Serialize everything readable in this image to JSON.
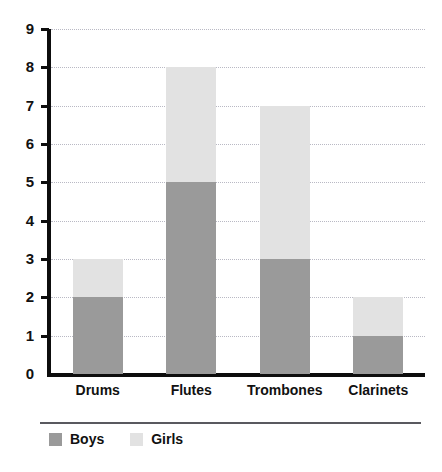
{
  "chart_data": {
    "type": "bar",
    "stacked": true,
    "title": "",
    "subtitle": "",
    "xlabel": "",
    "ylabel": "",
    "categories": [
      "Drums",
      "Flutes",
      "Trombones",
      "Clarinets"
    ],
    "series": [
      {
        "name": "Boys",
        "color": "#9a9a9a",
        "values": [
          2,
          5,
          3,
          1
        ]
      },
      {
        "name": "Girls",
        "color": "#e2e2e2",
        "values": [
          1,
          3,
          4,
          1
        ]
      }
    ],
    "totals": [
      3,
      8,
      7,
      2
    ],
    "ylim": [
      0,
      9
    ],
    "ytick_labels": [
      "0",
      "1",
      "2",
      "3",
      "4",
      "5",
      "6",
      "7",
      "8",
      "9"
    ],
    "ytick_values": [
      0,
      1,
      2,
      3,
      4,
      5,
      6,
      7,
      8,
      9
    ],
    "grid": "horizontal-dotted",
    "legend_position": "bottom-left",
    "axis_color": "#0d0d0d",
    "grid_color": "#b9b9c4",
    "background": "#ffffff"
  }
}
